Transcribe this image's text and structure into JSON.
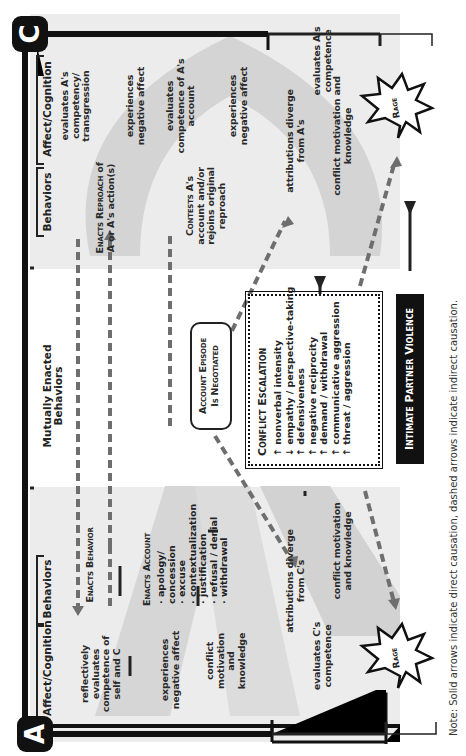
{
  "diagram": {
    "orientation": "rotated 90 degrees counterclockwise",
    "actors": {
      "left": "A",
      "right": "C"
    },
    "columns": {
      "a_affect": "Affect/Cognition",
      "a_behaviors": "Behaviors",
      "mutual": "Mutually Enacted Behaviors",
      "c_behaviors": "Behaviors",
      "c_affect": "Affect/Cognition"
    },
    "a_nodes": {
      "reflectively": "reflectively evaluates competence of self and C",
      "neg_affect": "experiences negative affect",
      "conflict": "conflict motivation and knowledge",
      "enacts_behavior": "Enacts Behavior",
      "enacts_account": "Enacts Account",
      "account_items": [
        "apology/ concession",
        "excuse",
        "contextualization",
        "justification",
        "refusal / denial",
        "withdrawal"
      ],
      "attributions": "attributions diverge from C's",
      "evaluates": "evaluates C's competence",
      "conflict2": "conflict motivation and knowledge",
      "rage": "Rage"
    },
    "c_nodes": {
      "evaluates_transgression": "evaluates A's competency/ transgression",
      "neg_affect1": "experiences negative affect",
      "evaluates_account": "evaluates competence of A's account",
      "neg_affect2": "experiences negative affect",
      "enacts_reproach": "Enacts Reproach",
      "reproach_rest": "of A or A's action(s)",
      "contests": "Contests",
      "contests_rest": "A's account and/or rejoins original reproach",
      "attributions": "attributions diverge from A's",
      "evaluates": "evaluates A's competence",
      "conflict2": "conflict motivation and knowledge",
      "rage": "Rage"
    },
    "center": {
      "account_episode": "Account Episode",
      "negotiated": "Is Negotiated",
      "escalation_title": "Conflict Escalation",
      "escalation_items": [
        {
          "arrow": "↑",
          "text": "nonverbal intensity"
        },
        {
          "arrow": "↓",
          "text": "empathy / perspective-taking"
        },
        {
          "arrow": "↑",
          "text": "defensiveness"
        },
        {
          "arrow": "↑",
          "text": "negative reciprocity"
        },
        {
          "arrow": "↑",
          "text": "demand / withdrawal"
        },
        {
          "arrow": "↑",
          "text": "communicative aggression"
        },
        {
          "arrow": "↑",
          "text": "threat / aggression"
        }
      ],
      "outcome": "Intimate Partner Violence"
    },
    "note": "Note: Solid arrows indicate direct causation, dashed arrows indicate indirect causation.",
    "colors": {
      "panel": "#ececec",
      "band": "#d4d4d4",
      "line": "#222222",
      "dashed": "#6e6e6e",
      "badge": "#111111"
    }
  }
}
